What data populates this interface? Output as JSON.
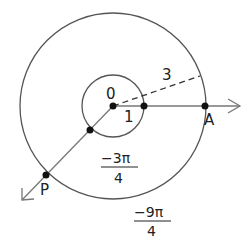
{
  "diagram": {
    "type": "angle-on-circles",
    "center_label": "0",
    "inner_radius_label": "1",
    "outer_radius_label": "3",
    "point_a_label": "A",
    "point_p_label": "P",
    "inner_angle": {
      "numerator": "−3π",
      "denominator": "4"
    },
    "outer_arc": {
      "numerator": "−9π",
      "denominator": "4"
    },
    "colors": {
      "stroke": "#555555",
      "ray": "#777777",
      "dot": "#111111",
      "text": "#222222"
    }
  }
}
